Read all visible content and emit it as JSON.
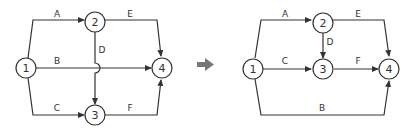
{
  "left_diagram": {
    "nodes": [
      {
        "id": "1",
        "label": "1"
      },
      {
        "id": "2",
        "label": "2"
      },
      {
        "id": "3",
        "label": "3"
      },
      {
        "id": "4",
        "label": "4"
      }
    ],
    "edges": [
      {
        "from": "1",
        "to": "2",
        "label": "A"
      },
      {
        "from": "1",
        "to": "4",
        "label": "B"
      },
      {
        "from": "1",
        "to": "3",
        "label": "C"
      },
      {
        "from": "2",
        "to": "3",
        "label": "D"
      },
      {
        "from": "2",
        "to": "4",
        "label": "E"
      },
      {
        "from": "3",
        "to": "4",
        "label": "F"
      }
    ]
  },
  "transform_arrow": "right-arrow",
  "right_diagram": {
    "nodes": [
      {
        "id": "1",
        "label": "1"
      },
      {
        "id": "2",
        "label": "2"
      },
      {
        "id": "3",
        "label": "3"
      },
      {
        "id": "4",
        "label": "4"
      }
    ],
    "edges": [
      {
        "from": "1",
        "to": "2",
        "label": "A"
      },
      {
        "from": "1",
        "to": "3",
        "label": "C"
      },
      {
        "from": "2",
        "to": "3",
        "label": "D"
      },
      {
        "from": "2",
        "to": "4",
        "label": "E"
      },
      {
        "from": "3",
        "to": "4",
        "label": "F"
      },
      {
        "from": "1",
        "to": "4",
        "label": "B"
      }
    ]
  }
}
